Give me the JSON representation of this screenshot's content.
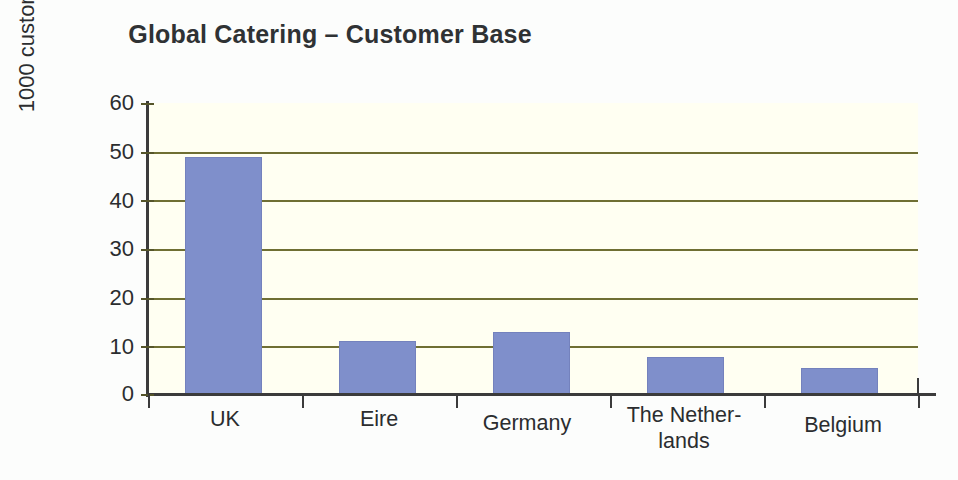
{
  "chart_data": {
    "type": "bar",
    "title": "Global Catering – Customer Base",
    "xlabel": "",
    "ylabel": "1000 customers",
    "categories": [
      "UK",
      "Eire",
      "Germany",
      "The Nether-\nlands",
      "Belgium"
    ],
    "values": [
      49,
      11,
      13,
      7.8,
      5.6
    ],
    "ylim": [
      0,
      60
    ],
    "ytick_values": [
      0,
      10,
      20,
      30,
      40,
      50,
      60
    ],
    "ytick_labels": [
      "0",
      "10",
      "20",
      "30",
      "40",
      "50",
      "60"
    ],
    "grid": true,
    "grid_axis": "y",
    "legend": false,
    "legend_position": "none",
    "series": [
      {
        "name": "Customers",
        "values": [
          49,
          11,
          13,
          7.8,
          5.6
        ]
      }
    ]
  },
  "axis": {
    "ylabel_text": "1000 customers",
    "yticks": [
      {
        "value": 60,
        "label": "60"
      },
      {
        "value": 50,
        "label": "50"
      },
      {
        "value": 40,
        "label": "40"
      },
      {
        "value": 30,
        "label": "30"
      },
      {
        "value": 20,
        "label": "20"
      },
      {
        "value": 10,
        "label": "10"
      },
      {
        "value": 0,
        "label": "0"
      }
    ]
  },
  "categories": [
    {
      "label_line1": "UK",
      "label_line2": "",
      "value": 49
    },
    {
      "label_line1": "Eire",
      "label_line2": "",
      "value": 11
    },
    {
      "label_line1": "Germany",
      "label_line2": "",
      "value": 13
    },
    {
      "label_line1": "The Nether-",
      "label_line2": "lands",
      "value": 7.8
    },
    {
      "label_line1": "Belgium",
      "label_line2": "",
      "value": 5.6
    }
  ],
  "colors": {
    "bar_fill": "#7f8fcb",
    "bar_stroke": "#7482bd",
    "gridline": "#6f6f33",
    "axis": "#3b3b3b",
    "plot_background": "#fffff2",
    "page_background": "#fcfdfc",
    "title_text": "#2f3234",
    "axis_text": "#2b2d2f"
  }
}
